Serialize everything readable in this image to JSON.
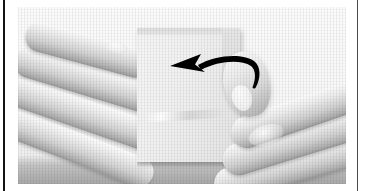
{
  "figure": {
    "kind": "halftone-photograph",
    "title": "Two hands holding a folded paper card with a left-pointing curved fold arrow",
    "palette": {
      "page_background": "#ffffff",
      "rule_left": "#141414",
      "rule_right": "#4a4a4a",
      "photo_background": "#f3f3f3",
      "scene_paper_white": "#fbfbfb",
      "skin_highlight": "#fdfdfd",
      "skin_midtone": "#d0d0d0",
      "skin_shadow": "#969696",
      "card_face": "#f1f1f1",
      "card_edge": "#dedede",
      "arrow_ink": "#000000",
      "table_shadow": "#585858"
    },
    "photo": {
      "x": 18,
      "y": 7,
      "width": 328,
      "height": 177,
      "halftone_screen": true
    },
    "rules": [
      {
        "name": "left-column-rule",
        "x": 3,
        "width": 2
      },
      {
        "name": "right-column-rule",
        "x": 357,
        "width": 1
      }
    ],
    "subjects": {
      "left_hand": {
        "label": "left hand",
        "finger_count": 4,
        "direction": "upper-left to lower-right",
        "fingers": [
          {
            "label": "index finger",
            "rotation_deg": 15,
            "length": 128
          },
          {
            "label": "middle finger",
            "rotation_deg": 17,
            "length": 146
          },
          {
            "label": "ring finger",
            "rotation_deg": 19,
            "length": 156
          },
          {
            "label": "little finger",
            "rotation_deg": 21,
            "length": 162
          }
        ]
      },
      "right_hand": {
        "label": "right hand",
        "finger_count": 3,
        "direction": "upper-right to lower-left",
        "fingertip_pressing_card": true,
        "fingers": [
          {
            "label": "middle finger",
            "rotation_deg": -19,
            "length": 150
          },
          {
            "label": "ring finger",
            "rotation_deg": -17,
            "length": 158
          },
          {
            "label": "little finger",
            "rotation_deg": -15,
            "length": 160
          }
        ]
      },
      "card": {
        "label": "folded paper card",
        "x": 119,
        "y": 21,
        "width": 103,
        "height": 134,
        "has_top_flap": true,
        "has_right_step": true,
        "has_crease_line": true,
        "casts_shadow": true
      }
    },
    "annotation": {
      "arrow": {
        "label": "fold-direction arrow",
        "shape": "curved arrow with hooked tail",
        "points_toward": "left",
        "color": "#000000",
        "x": 150,
        "y": 38,
        "width": 96,
        "height": 56,
        "head_tip_x": 152,
        "tail_hook_x": 243
      }
    },
    "caption": ""
  }
}
